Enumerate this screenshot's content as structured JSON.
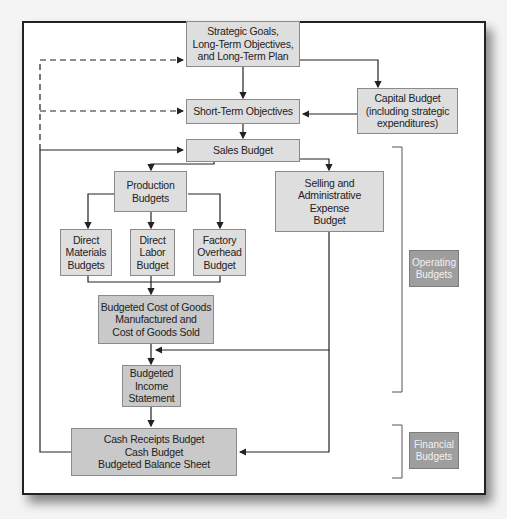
{
  "diagram": {
    "nodes": {
      "strategic": "Strategic Goals,\nLong-Term Objectives,\nand Long-Term Plan",
      "short_term": "Short-Term Objectives",
      "capital": "Capital Budget\n(including strategic\nexpenditures)",
      "sales": "Sales Budget",
      "production": "Production\nBudgets",
      "selling_admin": "Selling and\nAdministrative\nExpense\nBudget",
      "direct_materials": "Direct\nMaterials\nBudgets",
      "direct_labor": "Direct\nLabor\nBudget",
      "factory_overhead": "Factory\nOverhead\nBudget",
      "cogs": "Budgeted Cost of Goods\nManufactured and\nCost of Goods Sold",
      "income": "Budgeted\nIncome\nStatement",
      "cash": "Cash Receipts Budget\nCash Budget\nBudgeted Balance Sheet"
    },
    "groups": {
      "operating": "Operating\nBudgets",
      "financial": "Financial\nBudgets"
    },
    "edges": [
      {
        "from": "strategic",
        "to": "short_term",
        "style": "solid"
      },
      {
        "from": "strategic",
        "to": "capital",
        "style": "solid"
      },
      {
        "from": "capital",
        "to": "short_term",
        "style": "solid"
      },
      {
        "from": "short_term",
        "to": "sales",
        "style": "solid"
      },
      {
        "from": "sales",
        "to": "production",
        "style": "solid"
      },
      {
        "from": "sales",
        "to": "selling_admin",
        "style": "solid"
      },
      {
        "from": "production",
        "to": "direct_materials",
        "style": "solid"
      },
      {
        "from": "production",
        "to": "direct_labor",
        "style": "solid"
      },
      {
        "from": "production",
        "to": "factory_overhead",
        "style": "solid"
      },
      {
        "from": "direct_materials",
        "to": "cogs",
        "style": "solid"
      },
      {
        "from": "direct_labor",
        "to": "cogs",
        "style": "solid"
      },
      {
        "from": "factory_overhead",
        "to": "cogs",
        "style": "solid"
      },
      {
        "from": "cogs",
        "to": "income",
        "style": "solid"
      },
      {
        "from": "selling_admin",
        "to": "income",
        "style": "solid"
      },
      {
        "from": "income",
        "to": "cash",
        "style": "solid"
      },
      {
        "from": "selling_admin",
        "to": "cash",
        "style": "solid"
      },
      {
        "from": "cash",
        "to": "sales",
        "style": "solid"
      },
      {
        "from": "cash",
        "to": "strategic",
        "style": "dashed"
      },
      {
        "from": "cash",
        "to": "short_term",
        "style": "dashed"
      }
    ]
  }
}
